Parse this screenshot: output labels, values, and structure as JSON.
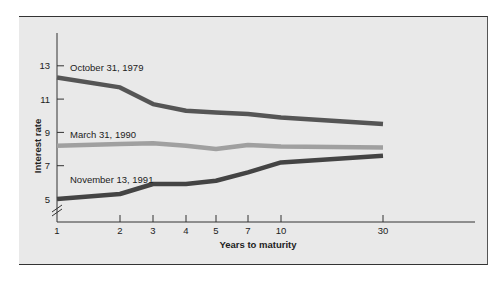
{
  "chart_data": {
    "type": "line",
    "title": "",
    "xlabel": "Years to maturity",
    "ylabel": "Interest rate",
    "x": [
      1,
      2,
      3,
      4,
      5,
      7,
      10,
      30
    ],
    "x_tick_labels": [
      "1",
      "2",
      "3",
      "4",
      "5",
      "7",
      "10",
      "30"
    ],
    "y_tick_labels": [
      "5",
      "7",
      "9",
      "11",
      "13"
    ],
    "y_ticks": [
      5,
      7,
      9,
      11,
      13
    ],
    "ylim": [
      3.6,
      14.6
    ],
    "y_axis_break": true,
    "grid": false,
    "legend_position": "inline labels above each line",
    "series": [
      {
        "name": "October 31, 1979",
        "color": "#555555",
        "values": [
          12.3,
          11.7,
          10.7,
          10.3,
          10.2,
          10.1,
          9.9,
          9.5
        ]
      },
      {
        "name": "March 31, 1990",
        "color": "#a0a0a0",
        "values": [
          8.2,
          8.3,
          8.35,
          8.2,
          8.0,
          8.25,
          8.15,
          8.1
        ]
      },
      {
        "name": "November 13, 1991",
        "color": "#444444",
        "values": [
          5.0,
          5.3,
          5.9,
          5.9,
          6.1,
          6.6,
          7.2,
          7.6
        ]
      }
    ]
  }
}
